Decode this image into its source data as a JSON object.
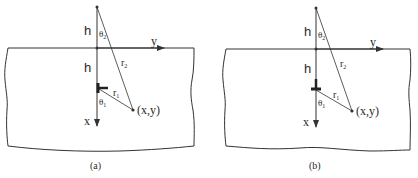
{
  "figure": {
    "panels": [
      {
        "id": "a",
        "caption": "(a)",
        "labels": {
          "h_top": "h",
          "h_bottom": "h",
          "theta2": "θ",
          "theta2_sub": "2",
          "theta1": "θ",
          "theta1_sub": "1",
          "r2": "r",
          "r2_sub": "2",
          "r1": "r",
          "r1_sub": "1",
          "x_axis": "x",
          "y_axis": "y",
          "point": "(x,y)"
        },
        "dislocation_orientation": "horizontal-bar (⊢ pointing right)"
      },
      {
        "id": "b",
        "caption": "(b)",
        "labels": {
          "h_top": "h",
          "h_bottom": "h",
          "theta2": "θ",
          "theta2_sub": "2",
          "theta1": "θ",
          "theta1_sub": "1",
          "r2": "r",
          "r2_sub": "2",
          "r1": "r",
          "r1_sub": "1",
          "x_axis": "x",
          "y_axis": "y",
          "point": "(x,y)"
        },
        "dislocation_orientation": "inverted T (⊥)"
      }
    ],
    "colors": {
      "line": "#333333",
      "background": "#ffffff"
    }
  }
}
